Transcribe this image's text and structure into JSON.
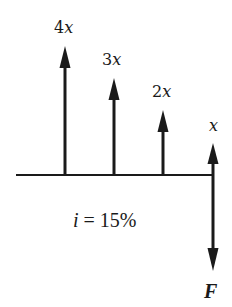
{
  "diagram": {
    "type": "cash-flow-diagram",
    "colors": {
      "ink": "#1a1a1a",
      "background": "#ffffff"
    },
    "interest_rate": {
      "symbol": "i",
      "equals": "=",
      "value": "15%"
    },
    "cash_flows": [
      {
        "period": 1,
        "coefficient": "4",
        "variable": "x",
        "direction": "up",
        "label": "4x"
      },
      {
        "period": 2,
        "coefficient": "3",
        "variable": "x",
        "direction": "up",
        "label": "3x"
      },
      {
        "period": 3,
        "coefficient": "2",
        "variable": "x",
        "direction": "up",
        "label": "2x"
      },
      {
        "period": 4,
        "coefficient": "",
        "variable": "x",
        "direction": "up",
        "label": "x"
      }
    ],
    "future_value": {
      "period": 4,
      "direction": "down",
      "label": "F"
    }
  }
}
